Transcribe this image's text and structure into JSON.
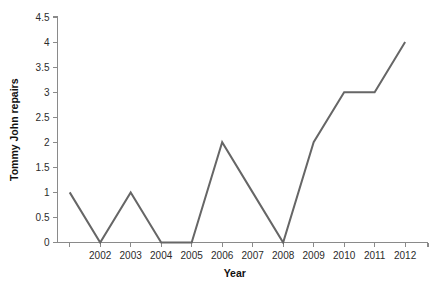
{
  "chart_data": {
    "type": "line",
    "title": "",
    "xlabel": "Year",
    "ylabel": "Tommy John repairs",
    "x": [
      2001,
      2002,
      2003,
      2004,
      2005,
      2006,
      2007,
      2008,
      2009,
      2010,
      2011,
      2012
    ],
    "values": [
      1,
      0,
      1,
      0,
      0,
      2,
      1,
      0,
      2,
      3,
      3,
      4
    ],
    "series": [
      {
        "name": "Tommy John repairs",
        "values": [
          1,
          0,
          1,
          0,
          0,
          2,
          1,
          0,
          2,
          3,
          3,
          4
        ]
      }
    ],
    "xlim": [
      2000.6,
      2012.75
    ],
    "ylim": [
      0,
      4.5
    ],
    "xticks": [
      2001,
      2002,
      2003,
      2004,
      2005,
      2006,
      2007,
      2008,
      2009,
      2010,
      2011,
      2012
    ],
    "xtick_labels": [
      "",
      "2002",
      "2003",
      "2004",
      "2005",
      "2006",
      "2007",
      "2008",
      "2009",
      "2010",
      "2011",
      "2012"
    ],
    "yticks": [
      0,
      0.5,
      1,
      1.5,
      2,
      2.5,
      3,
      3.5,
      4,
      4.5
    ],
    "ytick_labels": [
      "0",
      "0.5",
      "1",
      "1.5",
      "2",
      "2.5",
      "3",
      "3.5",
      "4",
      "4.5"
    ],
    "grid": false,
    "legend": false,
    "legend_position": "none",
    "line_color": "#666666",
    "line_width": 2,
    "axis_color": "#8a8a8a",
    "background_color": "#ffffff",
    "text_color": "#1a1a1a"
  }
}
